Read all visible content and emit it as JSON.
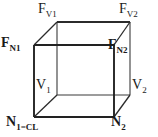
{
  "figure": {
    "background_color": "#ffffff",
    "line_color": "#2b2b2b",
    "text_color": "#1a1a1a"
  },
  "cube": {
    "description": "Wireframe cube in oblique projection; front face offset down-left from back face",
    "vertices": {
      "back_top_left": {
        "x": 57,
        "y": 22
      },
      "back_top_right": {
        "x": 130,
        "y": 22
      },
      "back_bottom_left": {
        "x": 57,
        "y": 95
      },
      "back_bottom_right": {
        "x": 130,
        "y": 95
      },
      "front_top_left": {
        "x": 34,
        "y": 45
      },
      "front_top_right": {
        "x": 114,
        "y": 45
      },
      "front_bottom_left": {
        "x": 34,
        "y": 117
      },
      "front_bottom_right": {
        "x": 114,
        "y": 117
      }
    },
    "edges": [
      [
        "back_top_left",
        "back_top_right"
      ],
      [
        "back_top_right",
        "back_bottom_right"
      ],
      [
        "back_bottom_right",
        "back_bottom_left"
      ],
      [
        "back_bottom_left",
        "back_top_left"
      ],
      [
        "front_top_left",
        "front_top_right"
      ],
      [
        "front_top_right",
        "front_bottom_right"
      ],
      [
        "front_bottom_right",
        "front_bottom_left"
      ],
      [
        "front_bottom_left",
        "front_top_left"
      ],
      [
        "front_top_left",
        "back_top_left"
      ],
      [
        "front_top_right",
        "back_top_right"
      ],
      [
        "front_bottom_left",
        "back_bottom_left"
      ],
      [
        "front_bottom_right",
        "back_bottom_right"
      ]
    ]
  },
  "labels": {
    "fv1": {
      "base": "F",
      "sub": "V1",
      "bold": false,
      "vertex": "back_top_left"
    },
    "fv2": {
      "base": "F",
      "sub": "V2",
      "bold": false,
      "vertex": "back_top_right"
    },
    "fn1": {
      "base": "F",
      "sub": "N1",
      "bold": true,
      "vertex": "front_top_left"
    },
    "fn2": {
      "base": "F",
      "sub": "N2",
      "bold": true,
      "vertex": "front_top_right"
    },
    "v1": {
      "base": "V",
      "sub": "1",
      "bold": false,
      "vertex": "back_bottom_left"
    },
    "v2": {
      "base": "V",
      "sub": "2",
      "bold": false,
      "vertex": "back_bottom_right"
    },
    "n1": {
      "base": "N",
      "sub": "1=CL",
      "bold": true,
      "vertex": "front_bottom_left"
    },
    "n2": {
      "base": "N",
      "sub": "2",
      "bold": true,
      "vertex": "front_bottom_right"
    }
  }
}
